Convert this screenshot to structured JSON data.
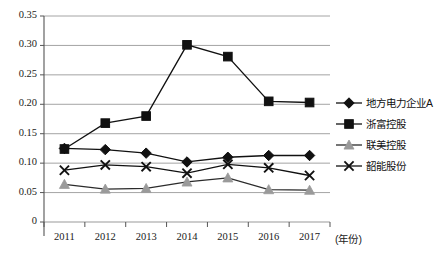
{
  "chart_data": {
    "type": "line",
    "title": "",
    "xlabel": "(年份)",
    "ylabel": "",
    "categories": [
      "2011",
      "2012",
      "2013",
      "2014",
      "2015",
      "2016",
      "2017"
    ],
    "ylim": [
      0,
      0.35
    ],
    "ytick_labels": [
      "0",
      "0.05",
      "0.10",
      "0.15",
      "0.20",
      "0.25",
      "0.30",
      "0.35"
    ],
    "ytick_values": [
      0,
      0.05,
      0.1,
      0.15,
      0.2,
      0.25,
      0.3,
      0.35
    ],
    "grid": "horizontal",
    "legend_position": "right",
    "series": [
      {
        "name": "地方电力企业A",
        "marker": "diamond",
        "color": "#111111",
        "values": [
          0.125,
          0.123,
          0.117,
          0.102,
          0.11,
          0.113,
          0.113
        ]
      },
      {
        "name": "浙富控股",
        "marker": "square",
        "color": "#111111",
        "values": [
          0.124,
          0.168,
          0.18,
          0.301,
          0.281,
          0.205,
          0.203
        ]
      },
      {
        "name": "联美控股",
        "marker": "triangle",
        "color": "#9a9a9a",
        "values": [
          0.064,
          0.056,
          0.057,
          0.068,
          0.075,
          0.055,
          0.054
        ]
      },
      {
        "name": "韶能股份",
        "marker": "cross",
        "color": "#111111",
        "values": [
          0.088,
          0.097,
          0.094,
          0.083,
          0.098,
          0.092,
          0.079
        ]
      }
    ]
  },
  "legend": {
    "items": [
      {
        "label": "地方电力企业A"
      },
      {
        "label": "浙富控股"
      },
      {
        "label": "联美控股"
      },
      {
        "label": "韶能股份"
      }
    ]
  },
  "axes": {
    "x_unit_label": "(年份)"
  }
}
